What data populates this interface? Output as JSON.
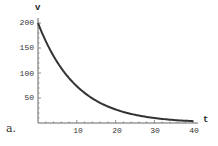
{
  "chart_data": {
    "type": "line",
    "title": "",
    "panel_label": "a.",
    "xlabel": "t",
    "ylabel": "v",
    "xlim": [
      0,
      41
    ],
    "ylim": [
      0,
      205
    ],
    "x_ticks": [
      10,
      20,
      30,
      40
    ],
    "y_ticks": [
      50,
      100,
      150,
      200
    ],
    "x_tick_labels": [
      "10",
      "20",
      "30",
      "40"
    ],
    "y_tick_labels": [
      "50",
      "100",
      "150",
      "200"
    ],
    "grid": false,
    "legend": null,
    "series": [
      {
        "name": "v(t)",
        "x": [
          0,
          2,
          4,
          6,
          8,
          10,
          12,
          14,
          16,
          18,
          20,
          22,
          24,
          26,
          28,
          30,
          32,
          34,
          36,
          38,
          40
        ],
        "values": [
          200,
          163.7,
          134.1,
          109.8,
          89.9,
          73.6,
          60.2,
          49.3,
          40.4,
          33.1,
          27.1,
          22.2,
          18.1,
          14.9,
          12.2,
          10.0,
          8.2,
          6.7,
          5.5,
          4.5,
          3.7
        ]
      }
    ]
  },
  "axes": {
    "x_name": "t",
    "y_name": "v",
    "x_ticks": [
      "10",
      "20",
      "30",
      "40"
    ],
    "y_ticks": [
      "200",
      "150",
      "100",
      "50"
    ]
  },
  "panel": {
    "label": "a."
  },
  "colors": {
    "curve": "#333333",
    "axis": "#555555",
    "background": "#ffffff"
  }
}
